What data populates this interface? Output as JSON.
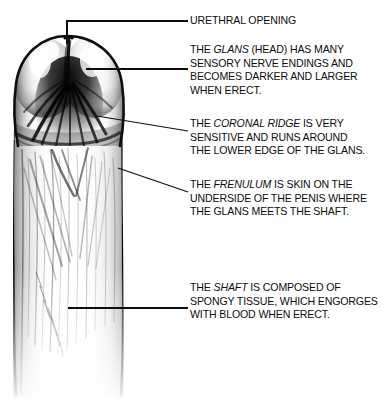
{
  "figure": {
    "background_color": "#ffffff",
    "ink_color": "#0d0d0d"
  },
  "callouts": [
    {
      "id": "urethral",
      "name": "urethral-opening",
      "lines": [
        [
          {
            "text": "URETHRAL OPENING",
            "style": "normal"
          }
        ]
      ]
    },
    {
      "id": "glans",
      "name": "glans",
      "lines": [
        [
          {
            "text": "THE ",
            "style": "normal"
          },
          {
            "text": "GLANS",
            "style": "italic"
          },
          {
            "text": " (HEAD) HAS MANY",
            "style": "normal"
          }
        ],
        [
          {
            "text": "SENSORY NERVE ENDINGS AND",
            "style": "normal"
          }
        ],
        [
          {
            "text": "BECOMES DARKER AND LARGER",
            "style": "normal"
          }
        ],
        [
          {
            "text": "WHEN ERECT.",
            "style": "normal"
          }
        ]
      ]
    },
    {
      "id": "coronal",
      "name": "coronal-ridge",
      "lines": [
        [
          {
            "text": "THE ",
            "style": "normal"
          },
          {
            "text": "CORONAL RIDGE",
            "style": "italic"
          },
          {
            "text": " IS VERY",
            "style": "normal"
          }
        ],
        [
          {
            "text": "SENSITIVE AND RUNS AROUND",
            "style": "normal"
          }
        ],
        [
          {
            "text": "THE LOWER EDGE OF THE GLANS.",
            "style": "normal"
          }
        ]
      ]
    },
    {
      "id": "frenulum",
      "name": "frenulum",
      "lines": [
        [
          {
            "text": "THE ",
            "style": "normal"
          },
          {
            "text": "FRENULUM",
            "style": "italic"
          },
          {
            "text": " IS SKIN ON THE",
            "style": "normal"
          }
        ],
        [
          {
            "text": "UNDERSIDE OF THE PENIS WHERE",
            "style": "normal"
          }
        ],
        [
          {
            "text": "THE GLANS MEETS THE SHAFT.",
            "style": "normal"
          }
        ]
      ]
    },
    {
      "id": "shaft",
      "name": "shaft",
      "lines": [
        [
          {
            "text": "THE ",
            "style": "normal"
          },
          {
            "text": "SHAFT",
            "style": "italic"
          },
          {
            "text": " IS COMPOSED OF",
            "style": "normal"
          }
        ],
        [
          {
            "text": "SPONGY TISSUE, WHICH ENGORGES",
            "style": "normal"
          }
        ],
        [
          {
            "text": "WITH BLOOD WHEN ERECT.",
            "style": "normal"
          }
        ]
      ]
    }
  ],
  "leader_lines": [
    {
      "name": "leader-urethral-opening",
      "type": "elbow",
      "points": "67,44 67,21 188,21"
    },
    {
      "name": "leader-glans",
      "type": "horizontal",
      "points": "86,69 188,69"
    },
    {
      "name": "leader-coronal-ridge",
      "type": "diagonal",
      "points": "97,116 188,131"
    },
    {
      "name": "leader-frenulum",
      "type": "diagonal",
      "points": "118,168 188,192"
    },
    {
      "name": "leader-shaft",
      "type": "horizontal",
      "points": "68,308 188,308"
    }
  ]
}
